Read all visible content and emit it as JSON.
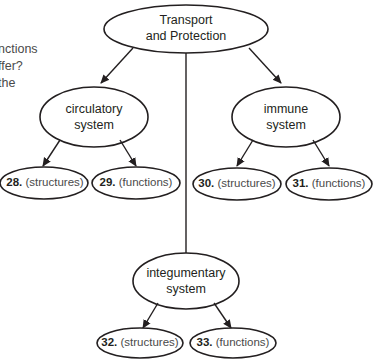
{
  "side_text": {
    "line1": "nctions",
    "line2": "ffer?",
    "line3": "the"
  },
  "root": {
    "line1": "Transport",
    "line2": "and Protection"
  },
  "branches": [
    {
      "line1": "circulatory",
      "line2": "system",
      "children": [
        {
          "number": "28.",
          "label": "(structures)"
        },
        {
          "number": "29.",
          "label": "(functions)"
        }
      ]
    },
    {
      "line1": "immune",
      "line2": "system",
      "children": [
        {
          "number": "30.",
          "label": "(structures)"
        },
        {
          "number": "31.",
          "label": "(functions)"
        }
      ]
    },
    {
      "line1": "integumentary",
      "line2": "system",
      "children": [
        {
          "number": "32.",
          "label": "(structures)"
        },
        {
          "number": "33.",
          "label": "(functions)"
        }
      ]
    }
  ],
  "colors": {
    "stroke": "#231f20",
    "text": "#231f20",
    "muted": "#4a4a4a"
  }
}
